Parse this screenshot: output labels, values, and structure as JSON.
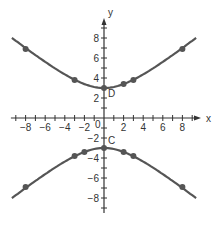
{
  "chart_data": {
    "type": "line",
    "title": "",
    "xlabel": "x",
    "ylabel": "y",
    "xlim": [
      -9.5,
      9.5
    ],
    "ylim": [
      -9.5,
      9.5
    ],
    "grid": false,
    "x_ticks": [
      -8,
      -6,
      -4,
      -2,
      2,
      4,
      6,
      8
    ],
    "x_tick_labels": [
      "−8",
      "−6",
      "−4",
      "−2",
      "2",
      "4",
      "6",
      "8"
    ],
    "y_ticks": [
      -8,
      -6,
      -4,
      -2,
      2,
      4,
      6,
      8
    ],
    "y_tick_labels": [
      "−8",
      "−6",
      "−4",
      "−2",
      "2",
      "4",
      "6",
      "8"
    ],
    "origin_label": "0",
    "series": [
      {
        "name": "upper branch",
        "points": [
          [
            -8,
            6.9
          ],
          [
            -3,
            3.8
          ],
          [
            0,
            3
          ],
          [
            2,
            3.4
          ],
          [
            3,
            3.8
          ],
          [
            8,
            6.9
          ]
        ]
      },
      {
        "name": "lower branch",
        "points": [
          [
            -8,
            -6.9
          ],
          [
            -3,
            -3.8
          ],
          [
            -2,
            -3.4
          ],
          [
            0,
            -3
          ],
          [
            2,
            -3.4
          ],
          [
            3,
            -3.8
          ],
          [
            8,
            -6.9
          ]
        ]
      }
    ],
    "annotations": [
      {
        "label": "D",
        "x": 0,
        "y": 3
      },
      {
        "label": "C",
        "x": 0,
        "y": -3
      }
    ],
    "curve_color": "#555555"
  }
}
